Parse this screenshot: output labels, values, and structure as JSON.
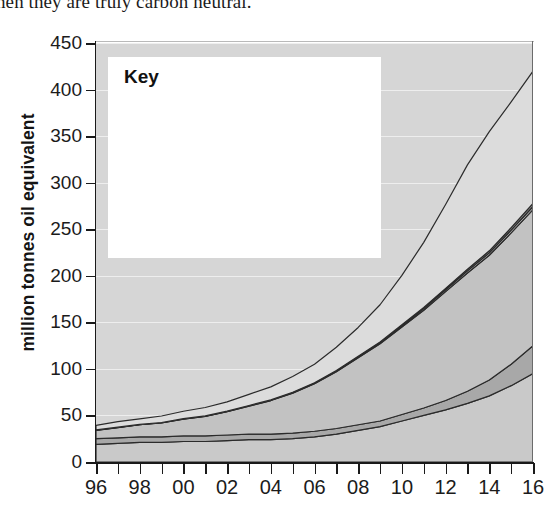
{
  "caption": {
    "text": "hen they are truly carbon neutral."
  },
  "chart_data": {
    "type": "area",
    "title": "",
    "subtitle": "",
    "xlabel": "",
    "ylabel": "million tonnes oil equivalent",
    "xlim": [
      1996,
      2016
    ],
    "ylim": [
      0,
      450
    ],
    "grid": true,
    "stacked": true,
    "legend_position": "top-left",
    "legend_title": "Key",
    "x": [
      1996,
      1997,
      1998,
      1999,
      2000,
      2001,
      2002,
      2003,
      2004,
      2005,
      2006,
      2007,
      2008,
      2009,
      2010,
      2011,
      2012,
      2013,
      2014,
      2015,
      2016
    ],
    "x_tick_labels": [
      "96",
      "98",
      "00",
      "02",
      "04",
      "06",
      "08",
      "10",
      "12",
      "14",
      "16"
    ],
    "y_tick_labels": [
      "0",
      "50",
      "100",
      "150",
      "200",
      "250",
      "300",
      "350",
      "400",
      "450"
    ],
    "series": [
      {
        "name": "North America",
        "color": "#c9c9c9",
        "values": [
          19,
          20,
          21,
          21,
          22,
          22,
          23,
          24,
          24,
          25,
          27,
          30,
          34,
          38,
          44,
          50,
          56,
          63,
          71,
          82,
          95
        ]
      },
      {
        "name": "South and Central America",
        "color": "#a8a8a8",
        "values": [
          6,
          6,
          6,
          6,
          6,
          6,
          6,
          6,
          6,
          6,
          6,
          6,
          6,
          6,
          7,
          8,
          10,
          13,
          17,
          23,
          30
        ]
      },
      {
        "name": "Europe and Eurasia",
        "color": "#c2c2c2",
        "values": [
          9,
          11,
          13,
          15,
          18,
          21,
          25,
          30,
          36,
          43,
          51,
          61,
          72,
          83,
          94,
          105,
          117,
          127,
          134,
          141,
          146
        ]
      },
      {
        "name": "Middle East",
        "color": "#bfbfbf",
        "values": [
          0.2,
          0.2,
          0.2,
          0.2,
          0.3,
          0.3,
          0.3,
          0.4,
          0.4,
          0.5,
          0.6,
          0.7,
          0.9,
          1.1,
          1.4,
          1.7,
          2.0,
          2.3,
          2.6,
          3.0,
          3.4
        ]
      },
      {
        "name": "Africa",
        "color": "#8e8e8e",
        "values": [
          0.2,
          0.2,
          0.2,
          0.2,
          0.2,
          0.2,
          0.3,
          0.3,
          0.3,
          0.4,
          0.4,
          0.5,
          0.6,
          0.8,
          1.0,
          1.2,
          1.5,
          1.8,
          2.2,
          2.7,
          3.3
        ]
      },
      {
        "name": "Asia Pacific",
        "color": "#dcdcdc",
        "values": [
          5,
          6,
          6,
          7,
          8,
          9,
          10,
          12,
          14,
          17,
          20,
          25,
          31,
          40,
          53,
          70,
          90,
          112,
          128,
          135,
          142
        ]
      }
    ],
    "totals": [
      39,
      43,
      46,
      49,
      54,
      58,
      64,
      72,
      81,
      92,
      105,
      123,
      144,
      169,
      200,
      236,
      277,
      319,
      355,
      387,
      420
    ],
    "colors": {
      "plot_background": "#d6d6d6",
      "gridline": "#f2f2f2",
      "axis": "#1a1a1a",
      "legend_background": "#ffffff",
      "series_outline": "#2b2b2b"
    }
  },
  "legend": {
    "title": "Key",
    "items": [
      {
        "label": "Asia Pacific",
        "color": "#dcdcdc"
      },
      {
        "label": "Africa",
        "color": "#8e8e8e"
      },
      {
        "label": "Middle East",
        "color": "#bfbfbf"
      },
      {
        "label": "Europe and Eurasia",
        "color": "#c2c2c2"
      },
      {
        "label": "South and Central America",
        "color": "#a8a8a8"
      },
      {
        "label": "North America",
        "color": "#c9c9c9"
      }
    ]
  },
  "yaxis": {
    "title": "million tonnes oil equivalent",
    "ticks": [
      450,
      400,
      350,
      300,
      250,
      200,
      150,
      100,
      50,
      0
    ]
  },
  "xaxis": {
    "ticks": [
      "96",
      "98",
      "00",
      "02",
      "04",
      "06",
      "08",
      "10",
      "12",
      "14",
      "16"
    ]
  }
}
